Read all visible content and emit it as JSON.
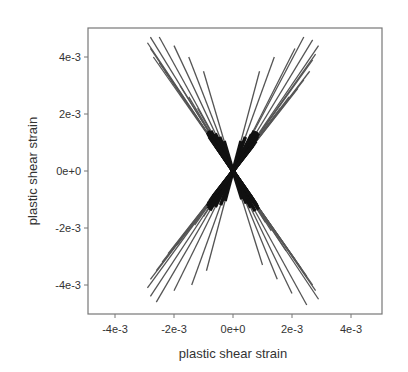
{
  "chart_data": {
    "type": "line",
    "title": "",
    "xlabel": "plastic shear strain",
    "ylabel": "plastic shear strain",
    "xlim": [
      -0.0052,
      0.005
    ],
    "ylim": [
      -0.005,
      0.005
    ],
    "x_ticks": [
      -0.004,
      -0.002,
      0,
      0.002,
      0.004
    ],
    "x_tick_labels": [
      "-4e-3",
      "-2e-3",
      "0e+0",
      "2e-3",
      "4e-3"
    ],
    "y_ticks": [
      0.004,
      0.002,
      0,
      -0.002,
      -0.004
    ],
    "y_tick_labels": [
      "4e-3",
      "2e-3",
      "0e+0",
      "-2e-3",
      "-4e-3"
    ],
    "grid": false,
    "legend": null,
    "series_color": "#555555",
    "series": [
      {
        "name": "upper-left paths",
        "endpoints": [
          [
            -0.0028,
            0.0047
          ],
          [
            -0.0025,
            0.0047
          ],
          [
            -0.0029,
            0.0045
          ],
          [
            -0.0028,
            0.0043
          ],
          [
            -0.0027,
            0.004
          ],
          [
            -0.0025,
            0.0038
          ],
          [
            -0.002,
            0.0044
          ],
          [
            -0.0015,
            0.004
          ],
          [
            -0.0023,
            0.0035
          ],
          [
            -0.0021,
            0.0032
          ],
          [
            -0.0018,
            0.003
          ],
          [
            -0.001,
            0.0035
          ],
          [
            -0.0015,
            0.0026
          ],
          [
            -0.0012,
            0.0022
          ]
        ]
      },
      {
        "name": "upper-right paths",
        "endpoints": [
          [
            0.0024,
            0.0047
          ],
          [
            0.0027,
            0.0046
          ],
          [
            0.0029,
            0.0044
          ],
          [
            0.0028,
            0.0041
          ],
          [
            0.0027,
            0.0039
          ],
          [
            0.0021,
            0.0043
          ],
          [
            0.0026,
            0.0035
          ],
          [
            0.0024,
            0.0032
          ],
          [
            0.0014,
            0.004
          ],
          [
            0.0022,
            0.0029
          ],
          [
            0.0019,
            0.0026
          ],
          [
            0.0009,
            0.0035
          ],
          [
            0.0016,
            0.0022
          ],
          [
            0.0013,
            0.0019
          ]
        ]
      },
      {
        "name": "lower-left paths",
        "endpoints": [
          [
            -0.0028,
            -0.0044
          ],
          [
            -0.0026,
            -0.0046
          ],
          [
            -0.0029,
            -0.0041
          ],
          [
            -0.0028,
            -0.0038
          ],
          [
            -0.002,
            -0.0042
          ],
          [
            -0.0026,
            -0.0035
          ],
          [
            -0.0024,
            -0.0032
          ],
          [
            -0.0014,
            -0.004
          ],
          [
            -0.0022,
            -0.0029
          ],
          [
            -0.0019,
            -0.0026
          ],
          [
            -0.0009,
            -0.0035
          ],
          [
            -0.0016,
            -0.0022
          ],
          [
            -0.0013,
            -0.0019
          ],
          [
            -0.001,
            -0.0016
          ]
        ]
      },
      {
        "name": "upper-right mirrored lower-right paths",
        "endpoints": [
          [
            0.0025,
            -0.0047
          ],
          [
            0.0029,
            -0.0045
          ],
          [
            0.0028,
            -0.0042
          ],
          [
            0.0027,
            -0.004
          ],
          [
            0.002,
            -0.0043
          ],
          [
            0.0025,
            -0.0037
          ],
          [
            0.0023,
            -0.0034
          ],
          [
            0.0015,
            -0.0038
          ],
          [
            0.0021,
            -0.0031
          ],
          [
            0.0018,
            -0.0028
          ],
          [
            0.001,
            -0.0033
          ],
          [
            0.0016,
            -0.0024
          ],
          [
            0.0013,
            -0.0021
          ],
          [
            0.0011,
            -0.0018
          ]
        ]
      }
    ]
  },
  "plot_area": {
    "left": 88,
    "top": 28,
    "right": 382,
    "bottom": 314
  },
  "axis_mapping": {
    "x0_px": 233,
    "x_px_per_unit": 29500,
    "y0_px": 171,
    "y_px_per_unit": 28500
  }
}
